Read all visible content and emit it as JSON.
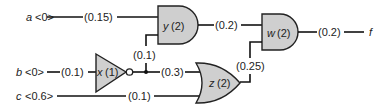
{
  "inputs": [
    {
      "name": "a",
      "value": "<0>",
      "wire_delay": "(0.15)"
    },
    {
      "name": "b",
      "value": "<0>",
      "wire_delay": "(0.1)"
    },
    {
      "name": "c",
      "value": "<0.6>",
      "wire_delay": "(0.1)"
    }
  ],
  "gates": {
    "y": {
      "name": "y",
      "delay": "(2)",
      "type": "AND"
    },
    "x": {
      "name": "x",
      "delay": "(1)",
      "type": "NOT"
    },
    "z": {
      "name": "z",
      "delay": "(2)",
      "type": "OR"
    },
    "w": {
      "name": "w",
      "delay": "(2)",
      "type": "AND"
    }
  },
  "wires": {
    "x_to_y": "(0.1)",
    "x_to_z": "(0.3)",
    "y_to_w": "(0.2)",
    "z_to_w": "(0.25)",
    "w_to_f": "(0.2)"
  },
  "output": {
    "name": "f"
  },
  "colors": {
    "gate_fill": "#cfcfcf",
    "wire": "#111111"
  }
}
